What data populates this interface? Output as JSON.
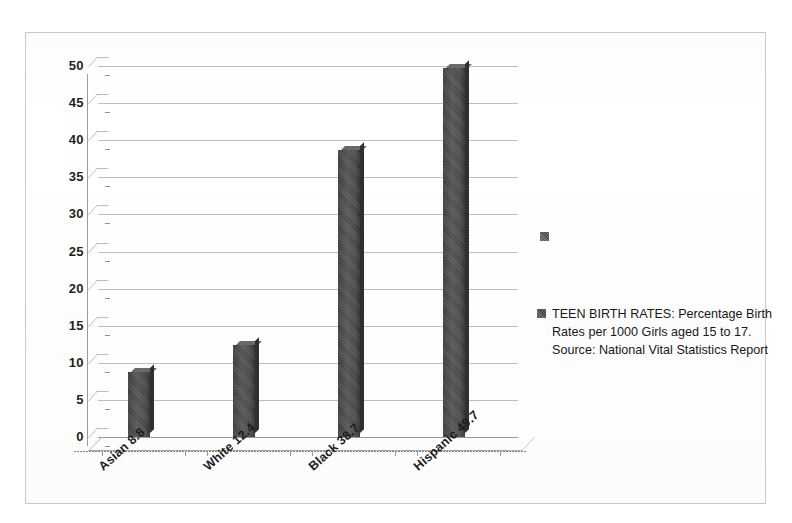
{
  "chart_data": {
    "type": "bar",
    "title": "",
    "subtitle": "",
    "xlabel": "",
    "ylabel": "",
    "categories": [
      "Asian 8.8",
      "White 12.4",
      "Black 38.7",
      "Hispanic 49.7"
    ],
    "values": [
      8.8,
      12.4,
      38.7,
      49.7
    ],
    "series": [
      {
        "name": "TEEN BIRTH RATES: Percentage Birth Rates per 1000 Girls aged 15 to 17.  Source:  National Vital Statistics Report",
        "values": [
          8.8,
          12.4,
          38.7,
          49.7
        ]
      }
    ],
    "ylim": [
      0,
      50
    ],
    "yticks": [
      "0",
      "5",
      "10",
      "15",
      "20",
      "25",
      "30",
      "35",
      "40",
      "45",
      "50"
    ],
    "ytick_values": [
      0,
      5,
      10,
      15,
      20,
      25,
      30,
      35,
      40,
      45,
      50
    ],
    "grid": true,
    "legend_position": "right",
    "bar_color": "#4b4b4b",
    "grid_color": "#bfbfbf",
    "axis_color": "#9b9b9b",
    "background_color": "#ffffff"
  },
  "legend": {
    "swatch_icon": "legend-swatch-icon",
    "label": "TEEN BIRTH RATES: Percentage Birth Rates per 1000 Girls aged 15 to 17.  Source:  National Vital Statistics Report"
  },
  "artifacts": {
    "stray_marker_icon": "legend-swatch-icon"
  }
}
